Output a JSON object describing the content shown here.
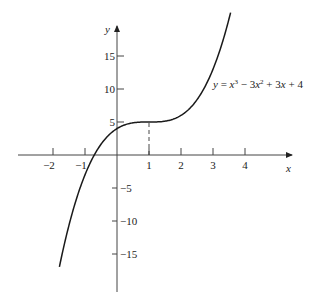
{
  "chart_data": {
    "type": "line",
    "title": "",
    "xlabel": "x",
    "ylabel": "y",
    "equation_label": "y = x³ − 3x² + 3x + 4",
    "function": "x^3 - 3x^2 + 3x + 4",
    "xlim": [
      -3.2,
      5.2
    ],
    "ylim": [
      -21,
      22
    ],
    "x_ticks": [
      -2,
      -1,
      1,
      2,
      3,
      4
    ],
    "x_tick_labels": [
      "−2",
      "−1",
      "1",
      "2",
      "3",
      "4"
    ],
    "y_ticks": [
      15,
      10,
      5,
      -5,
      -10,
      -15
    ],
    "y_tick_labels": [
      "15",
      "10",
      "5",
      "−5",
      "−10",
      "−15"
    ],
    "grid": false,
    "legend": null,
    "annotations": [
      {
        "type": "dashed-vertical",
        "x": 1,
        "y_from": 0,
        "y_to": 5,
        "note": "inflection point (1, 5)"
      }
    ],
    "series": [
      {
        "name": "y = x^3 - 3x^2 + 3x + 4",
        "x": [
          -1.8,
          -1.5,
          -1.0,
          -0.74,
          -0.5,
          0,
          0.5,
          1.0,
          1.5,
          2.0,
          2.5,
          3.0,
          3.3,
          3.55
        ],
        "y": [
          -16.95,
          -11.63,
          -3.0,
          0.0,
          2.63,
          4.0,
          4.88,
          5.0,
          5.13,
          6.0,
          8.38,
          13.0,
          16.98,
          20.91
        ]
      }
    ]
  }
}
